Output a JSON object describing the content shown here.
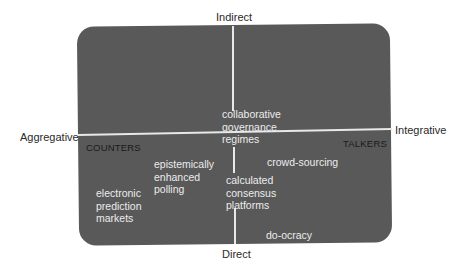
{
  "diagram": {
    "axes": {
      "top": "Indirect",
      "bottom": "Direct",
      "left": "Aggregative",
      "right": "Integrative"
    },
    "quadrant_labels": {
      "left": "COUNTERS",
      "right": "TALKERS"
    },
    "items": [
      {
        "id": "collaborative-governance-regimes",
        "label": "collaborative\ngovernance\nregimes"
      },
      {
        "id": "epistemically-enhanced-polling",
        "label": "epistemically\nenhanced\npolling"
      },
      {
        "id": "crowd-sourcing",
        "label": "crowd-sourcing"
      },
      {
        "id": "electronic-prediction-markets",
        "label": "electronic\nprediction\nmarkets"
      },
      {
        "id": "calculated-consensus-platforms",
        "label": "calculated\nconsensus\nplatforms"
      },
      {
        "id": "do-ocracy",
        "label": "do-ocracy"
      }
    ],
    "colors": {
      "box_fill": "#595959",
      "axis_line": "#e8e8e8",
      "item_text": "#ececec",
      "quadrant_label_text": "#1a1a1a",
      "axis_label_text": "#2a2a2a"
    }
  }
}
